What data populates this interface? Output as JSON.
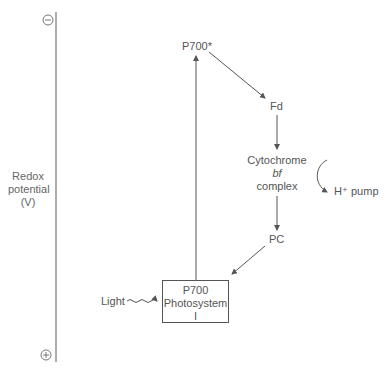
{
  "axis": {
    "label_line1": "Redox",
    "label_line2": "potential",
    "label_line3": "(V)",
    "top_sign": "−",
    "bottom_sign": "+"
  },
  "nodes": {
    "p700_excited": "P700*",
    "fd": "Fd",
    "cyt_line1": "Cytochrome",
    "cyt_line2": "bf",
    "cyt_line3": "complex",
    "h_pump": "H⁺ pump",
    "pc": "PC",
    "ps_line1": "P700",
    "ps_line2": "Photosystem",
    "ps_line3": "I",
    "light": "Light"
  },
  "colors": {
    "line": "#555555",
    "text": "#555555",
    "background": "#ffffff"
  }
}
